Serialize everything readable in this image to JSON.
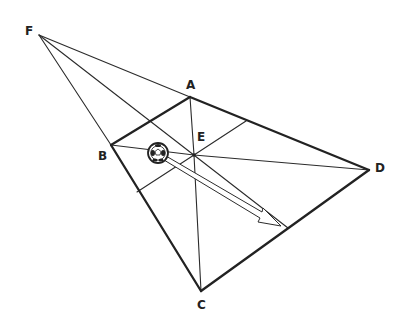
{
  "diagram": {
    "type": "geometry",
    "points": {
      "F": {
        "label": "F",
        "x": 39,
        "y": 35,
        "label_x": 25,
        "label_y": 35
      },
      "A": {
        "label": "A",
        "x": 190,
        "y": 97,
        "label_x": 186,
        "label_y": 89
      },
      "B": {
        "label": "B",
        "x": 111,
        "y": 145,
        "label_x": 98,
        "label_y": 160
      },
      "C": {
        "label": "C",
        "x": 201,
        "y": 291,
        "label_x": 197,
        "label_y": 309
      },
      "D": {
        "label": "D",
        "x": 369,
        "y": 170,
        "label_x": 375,
        "label_y": 172
      },
      "E": {
        "label": "E",
        "x": 194,
        "y": 155,
        "label_x": 197,
        "label_y": 141
      }
    },
    "edges_thick": [
      [
        "A",
        "B"
      ],
      [
        "A",
        "D"
      ],
      [
        "B",
        "C"
      ],
      [
        "C",
        "D"
      ]
    ],
    "edges_thin": [
      [
        "F",
        "A"
      ],
      [
        "F",
        "B"
      ],
      [
        "F",
        "E"
      ],
      [
        "E",
        "A"
      ],
      [
        "E",
        "B"
      ],
      [
        "E",
        "C"
      ],
      [
        "E",
        "D"
      ]
    ],
    "ball": {
      "icon": "soccer-ball-icon",
      "cx": 158,
      "cy": 153,
      "r": 10
    },
    "arrow": {
      "from": [
        165,
        158
      ],
      "to": [
        281,
        226
      ],
      "style": "hollow"
    },
    "colors": {
      "line": "#222222",
      "background": "#ffffff"
    }
  }
}
